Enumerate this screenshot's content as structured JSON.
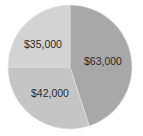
{
  "chart_data": {
    "type": "pie",
    "title": "",
    "categories": [
      "$63,000",
      "$42,000",
      "$35,000"
    ],
    "values": [
      63000,
      42000,
      35000
    ],
    "labels": [
      "$63,000",
      "$42,000",
      "$35,000"
    ],
    "colors": [
      "#a8a8a8",
      "#c5c5c5",
      "#d3d3d3"
    ],
    "start_angle_deg": 0,
    "direction": "clockwise",
    "legend": "none"
  }
}
